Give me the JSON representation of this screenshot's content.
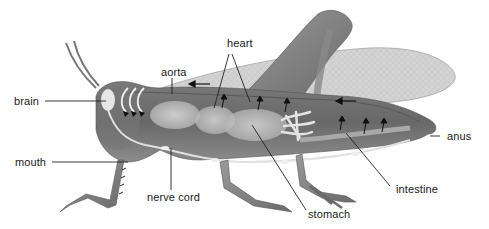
{
  "diagram": {
    "color_scheme": "grayscale",
    "colors": {
      "background": "#ffffff",
      "body_dark": "#6e6e6e",
      "body_mid": "#8a8a8a",
      "organ_light": "#c8c8c8",
      "nerve": "#dcdcdc",
      "wing": "#c4c4c4",
      "label_text": "#1a1a1a",
      "leader_line": "#222222"
    },
    "labels": {
      "brain": "brain",
      "aorta": "aorta",
      "heart": "heart",
      "mouth": "mouth",
      "nerve_cord": "nerve cord",
      "stomach": "stomach",
      "intestine": "intestine",
      "anus": "anus"
    },
    "flow_arrows": [
      {
        "name": "aorta-flow-arrow",
        "direction": "left"
      },
      {
        "name": "wing-flow-arrow",
        "direction": "left"
      }
    ]
  }
}
